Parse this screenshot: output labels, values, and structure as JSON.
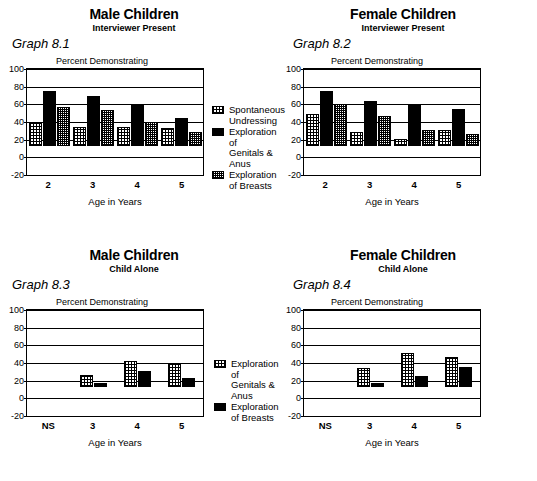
{
  "figure": {
    "axis_title_y": "Percent Demonstrating",
    "axis_title_x": "Age in Years",
    "y_ticks": [
      "100",
      "80",
      "60",
      "40",
      "20",
      "0",
      "-20"
    ],
    "ylim": [
      -20,
      100
    ]
  },
  "panels": [
    {
      "graph_number": "Graph 8.1",
      "title": "Male Children",
      "subtitle": "Interviewer Present",
      "legend": [
        {
          "key": "s1",
          "label": "Spontaneous\nUndressing"
        },
        {
          "key": "s2",
          "label": "Exploration of\nGenitals & Anus"
        },
        {
          "key": "s3",
          "label": "Exploration\nof Breasts"
        }
      ]
    },
    {
      "graph_number": "Graph 8.2",
      "title": "Female Children",
      "subtitle": "Interviewer Present",
      "legend": []
    },
    {
      "graph_number": "Graph 8.3",
      "title": "Male Children",
      "subtitle": "Child Alone",
      "legend": [
        {
          "key": "s1",
          "label": "Exploration of\nGenitals & Anus"
        },
        {
          "key": "s2",
          "label": "Exploration\nof Breasts"
        }
      ]
    },
    {
      "graph_number": "Graph 8.4",
      "title": "Female Children",
      "subtitle": "Child Alone",
      "legend": []
    }
  ],
  "chart_data": [
    {
      "type": "bar",
      "title": "Male Children",
      "subtitle": "Interviewer Present",
      "graph_number": "Graph 8.1",
      "xlabel": "Age in Years",
      "ylabel": "Percent Demonstrating",
      "ylim": [
        -20,
        100
      ],
      "yticks": [
        -20,
        0,
        20,
        40,
        60,
        80,
        100
      ],
      "grid": true,
      "legend_position": "right",
      "categories": [
        "2",
        "3",
        "4",
        "5"
      ],
      "series": [
        {
          "name": "Spontaneous Undressing",
          "values": [
            35,
            29,
            29,
            28
          ]
        },
        {
          "name": "Exploration of Genitals & Anus",
          "values": [
            85,
            78,
            64,
            43
          ]
        },
        {
          "name": "Exploration of Breasts",
          "values": [
            61,
            56,
            37,
            22
          ]
        }
      ]
    },
    {
      "type": "bar",
      "title": "Female Children",
      "subtitle": "Interviewer Present",
      "graph_number": "Graph 8.2",
      "xlabel": "Age in Years",
      "ylabel": "Percent Demonstrating",
      "ylim": [
        -20,
        100
      ],
      "yticks": [
        -20,
        0,
        20,
        40,
        60,
        80,
        100
      ],
      "grid": true,
      "legend_position": "left",
      "categories": [
        "2",
        "3",
        "4",
        "5"
      ],
      "series": [
        {
          "name": "Spontaneous Undressing",
          "values": [
            50,
            22,
            11,
            25
          ]
        },
        {
          "name": "Exploration of Genitals & Anus",
          "values": [
            86,
            70,
            63,
            57
          ]
        },
        {
          "name": "Exploration of Breasts",
          "values": [
            65,
            47,
            24,
            19
          ]
        }
      ]
    },
    {
      "type": "bar",
      "title": "Male Children",
      "subtitle": "Child Alone",
      "graph_number": "Graph 8.3",
      "xlabel": "Age in Years",
      "ylabel": "Percent Demonstrating",
      "ylim": [
        -20,
        100
      ],
      "yticks": [
        -20,
        0,
        20,
        40,
        60,
        80,
        100
      ],
      "grid": true,
      "legend_position": "right",
      "categories": [
        "NS",
        "3",
        "4",
        "5"
      ],
      "series": [
        {
          "name": "Exploration of Genitals & Anus",
          "values": [
            0,
            19,
            40,
            37
          ]
        },
        {
          "name": "Exploration of Breasts",
          "values": [
            0,
            6,
            24,
            14
          ]
        }
      ]
    },
    {
      "type": "bar",
      "title": "Female Children",
      "subtitle": "Child Alone",
      "graph_number": "Graph 8.4",
      "xlabel": "Age in Years",
      "ylabel": "Percent Demonstrating",
      "ylim": [
        -20,
        100
      ],
      "yticks": [
        -20,
        0,
        20,
        40,
        60,
        80,
        100
      ],
      "grid": true,
      "legend_position": "left",
      "categories": [
        "NS",
        "3",
        "4",
        "5"
      ],
      "series": [
        {
          "name": "Exploration of Genitals & Anus",
          "values": [
            0,
            30,
            52,
            46
          ]
        },
        {
          "name": "Exploration of Breasts",
          "values": [
            0,
            6,
            16,
            31
          ]
        }
      ]
    }
  ]
}
